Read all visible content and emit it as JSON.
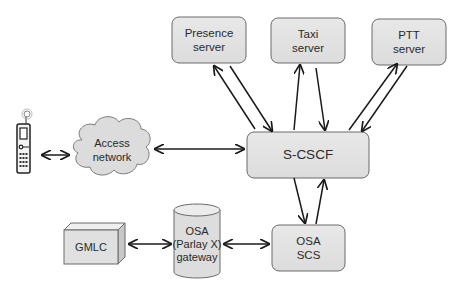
{
  "diagram": {
    "nodes": {
      "presence": {
        "line1": "Presence",
        "line2": "server"
      },
      "taxi": {
        "line1": "Taxi",
        "line2": "server"
      },
      "ptt": {
        "line1": "PTT",
        "line2": "server"
      },
      "scscf": {
        "label": "S-CSCF"
      },
      "access": {
        "line1": "Access",
        "line2": "network"
      },
      "gmlc": {
        "label": "GMLC"
      },
      "gateway": {
        "line1": "OSA",
        "line2": "(Parlay X)",
        "line3": "gateway"
      },
      "osascs": {
        "line1": "OSA",
        "line2": "SCS"
      },
      "phone": {
        "label": "mobile-phone"
      }
    },
    "edges": [
      {
        "from": "phone",
        "to": "access",
        "type": "bidirectional"
      },
      {
        "from": "access",
        "to": "scscf",
        "type": "bidirectional"
      },
      {
        "from": "presence",
        "to": "scscf",
        "type": "pair"
      },
      {
        "from": "taxi",
        "to": "scscf",
        "type": "pair"
      },
      {
        "from": "ptt",
        "to": "scscf",
        "type": "pair"
      },
      {
        "from": "scscf",
        "to": "osascs",
        "type": "pair"
      },
      {
        "from": "gmlc",
        "to": "gateway",
        "type": "bidirectional"
      },
      {
        "from": "gateway",
        "to": "osascs",
        "type": "bidirectional"
      }
    ],
    "colors": {
      "box_fill": "#e3e3e3",
      "box_stroke": "#666666",
      "arrow": "#1a1a1a"
    }
  }
}
